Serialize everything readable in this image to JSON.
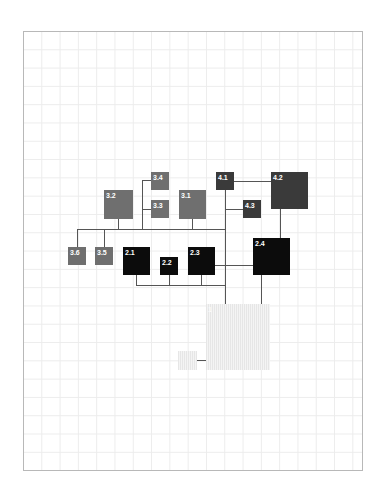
{
  "diagram": {
    "type": "hierarchy-tree",
    "colors": {
      "level1": "#ebebeb",
      "level2": "#0c0c0c",
      "level3": "#6f6f6f",
      "level4": "#3a3a3a",
      "connector": "#555555",
      "grid": "#ececec",
      "frame": "#b8b8b8"
    },
    "nodes": [
      {
        "id": "1",
        "label": "1",
        "level": 1
      },
      {
        "id": "1b",
        "label": "",
        "level": 1
      },
      {
        "id": "2.1",
        "label": "2.1",
        "level": 2
      },
      {
        "id": "2.2",
        "label": "2.2",
        "level": 2
      },
      {
        "id": "2.3",
        "label": "2.3",
        "level": 2
      },
      {
        "id": "2.4",
        "label": "2.4",
        "level": 2
      },
      {
        "id": "3.1",
        "label": "3.1",
        "level": 3
      },
      {
        "id": "3.2",
        "label": "3.2",
        "level": 3
      },
      {
        "id": "3.3",
        "label": "3.3",
        "level": 3
      },
      {
        "id": "3.4",
        "label": "3.4",
        "level": 3
      },
      {
        "id": "3.5",
        "label": "3.5",
        "level": 3
      },
      {
        "id": "3.6",
        "label": "3.6",
        "level": 3
      },
      {
        "id": "4.1",
        "label": "4.1",
        "level": 4
      },
      {
        "id": "4.2",
        "label": "4.2",
        "level": 4
      },
      {
        "id": "4.3",
        "label": "4.3",
        "level": 4
      }
    ],
    "edges": [
      [
        "1",
        "1b"
      ],
      [
        "1",
        "2.4"
      ],
      [
        "1",
        "4.1"
      ],
      [
        "4.1",
        "4.2"
      ],
      [
        "4.1",
        "4.3"
      ],
      [
        "4.2",
        "2.4"
      ],
      [
        "4.1",
        "3.1"
      ],
      [
        "4.1",
        "3.2"
      ],
      [
        "3.2",
        "3.3"
      ],
      [
        "3.2",
        "3.4"
      ],
      [
        "4.1",
        "3.5"
      ],
      [
        "4.1",
        "3.6"
      ],
      [
        "4.1",
        "2.1"
      ],
      [
        "4.1",
        "2.2"
      ],
      [
        "4.1",
        "2.3"
      ],
      [
        "4.1",
        "2.4"
      ]
    ]
  }
}
